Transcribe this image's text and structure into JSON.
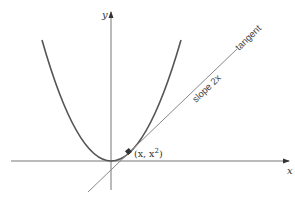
{
  "diagram": {
    "axes": {
      "x_label": "x",
      "y_label": "y"
    },
    "curve": {
      "name": "parabola",
      "equation": "y = x^2",
      "color": "#555555"
    },
    "tangent": {
      "label": "tangent",
      "slope_label": "slope 2x",
      "color": "#777777"
    },
    "point": {
      "label_x": "(x, x",
      "label_exp": "2",
      "label_close": ")",
      "color": "#333333"
    }
  }
}
